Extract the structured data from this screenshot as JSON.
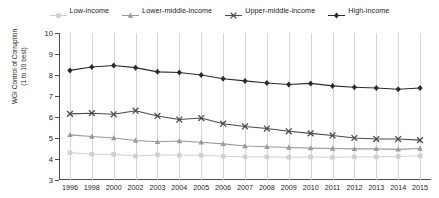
{
  "legend": {
    "position": "top-center",
    "items": [
      {
        "label": "Low-income",
        "marker": "square",
        "color": "#d0d0d0"
      },
      {
        "label": "Lower-middle-income",
        "marker": "triangle",
        "color": "#9a9a9a"
      },
      {
        "label": "Upper-middle-income",
        "marker": "x",
        "color": "#4a4a4a"
      },
      {
        "label": "High-income",
        "marker": "diamond",
        "color": "#2b2b2b"
      }
    ]
  },
  "axis": {
    "ylabel_line1": "WGI Control of Corruption",
    "ylabel_line2": "(1 to 10 best)",
    "yticks": [
      3,
      4,
      5,
      6,
      7,
      8,
      9,
      10
    ],
    "ymin": 3,
    "ymax": 10,
    "xlabel": ""
  },
  "chart_data": {
    "type": "line",
    "title": "",
    "subtitle": "",
    "xlabel": "",
    "ylabel": "WGI Control of Corruption (1 to 10 best)",
    "ylim": [
      3,
      10
    ],
    "grid": "vertical",
    "legend_position": "top-center",
    "categories": [
      "1996",
      "1998",
      "2000",
      "2002",
      "2003",
      "2004",
      "2005",
      "2006",
      "2007",
      "2008",
      "2009",
      "2010",
      "2011",
      "2012",
      "2013",
      "2014",
      "2015"
    ],
    "series": [
      {
        "name": "Low-income",
        "marker": "square",
        "color": "#d0d0d0",
        "values": [
          4.3,
          4.23,
          4.22,
          4.14,
          4.2,
          4.18,
          4.18,
          4.13,
          4.1,
          4.1,
          4.08,
          4.1,
          4.08,
          4.1,
          4.1,
          4.12,
          4.15
        ]
      },
      {
        "name": "Lower-middle-income",
        "marker": "triangle",
        "color": "#9a9a9a",
        "values": [
          5.15,
          5.07,
          5.0,
          4.88,
          4.82,
          4.86,
          4.8,
          4.72,
          4.62,
          4.58,
          4.55,
          4.52,
          4.5,
          4.48,
          4.48,
          4.46,
          4.5
        ]
      },
      {
        "name": "Upper-middle-income",
        "marker": "x",
        "color": "#4a4a4a",
        "values": [
          6.15,
          6.18,
          6.13,
          6.3,
          6.05,
          5.88,
          5.95,
          5.68,
          5.55,
          5.45,
          5.32,
          5.22,
          5.12,
          5.0,
          4.95,
          4.95,
          4.9
        ]
      },
      {
        "name": "High-income",
        "marker": "diamond",
        "color": "#2b2b2b",
        "values": [
          8.22,
          8.38,
          8.45,
          8.35,
          8.15,
          8.12,
          8.0,
          7.82,
          7.72,
          7.62,
          7.55,
          7.6,
          7.48,
          7.42,
          7.38,
          7.32,
          7.38
        ]
      }
    ]
  }
}
